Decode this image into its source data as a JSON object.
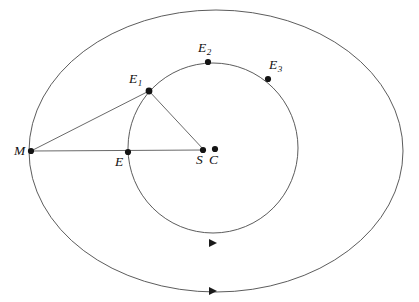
{
  "figure": {
    "background_color": "#ffffff",
    "curve_color": "#4a4a4a",
    "segment_color": "#585858",
    "point_color": "#141414",
    "width": 419,
    "height": 302
  },
  "curves": [
    {
      "id": "outer-ellipse",
      "name": "deferent-ellipse",
      "type": "ellipse",
      "cx": 216,
      "cy": 151,
      "rx": 187,
      "ry": 141
    },
    {
      "id": "inner-circle",
      "name": "epicycle-circle",
      "type": "circle",
      "cx": 213,
      "cy": 148,
      "r": 85
    }
  ],
  "direction_arrows": [
    {
      "id": "arrow-inner",
      "on": "inner-circle",
      "x": 213,
      "y": 243,
      "direction": "right"
    },
    {
      "id": "arrow-outer",
      "on": "outer-ellipse",
      "x": 213,
      "y": 291,
      "direction": "right"
    }
  ],
  "points": [
    {
      "id": "M",
      "label": "M",
      "sub": "",
      "x": 31,
      "y": 151,
      "label_x": 14,
      "label_y": 144
    },
    {
      "id": "E",
      "label": "E",
      "sub": "",
      "x": 128,
      "y": 152,
      "label_x": 115,
      "label_y": 155
    },
    {
      "id": "S",
      "label": "S",
      "sub": "",
      "x": 203,
      "y": 150,
      "label_x": 196,
      "label_y": 153
    },
    {
      "id": "C",
      "label": "C",
      "sub": "",
      "x": 215,
      "y": 149,
      "label_x": 209,
      "label_y": 153
    },
    {
      "id": "E1",
      "label": "E",
      "sub": "1",
      "x": 149,
      "y": 91,
      "label_x": 129,
      "label_y": 72
    },
    {
      "id": "E2",
      "label": "E",
      "sub": "2",
      "x": 208,
      "y": 62,
      "label_x": 198,
      "label_y": 41
    },
    {
      "id": "E3",
      "label": "E",
      "sub": "3",
      "x": 268,
      "y": 79,
      "label_x": 269,
      "label_y": 58
    }
  ],
  "segments": [
    {
      "id": "M-E1",
      "name": "segment-m-to-e1",
      "x1": 31,
      "y1": 151,
      "x2": 149,
      "y2": 91
    },
    {
      "id": "M-S",
      "name": "segment-m-to-s",
      "x1": 31,
      "y1": 151,
      "x2": 204,
      "y2": 150
    },
    {
      "id": "E1-S",
      "name": "segment-e1-to-s",
      "x1": 149,
      "y1": 91,
      "x2": 204,
      "y2": 150
    }
  ]
}
